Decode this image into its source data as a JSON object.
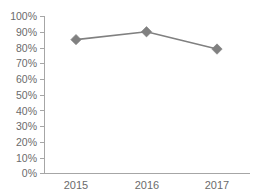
{
  "chart_data": {
    "type": "line",
    "title": "",
    "subtitle": "",
    "xlabel": "",
    "ylabel": "",
    "categories": [
      "2015",
      "2016",
      "2017"
    ],
    "values": [
      85,
      90,
      79
    ],
    "series": [
      {
        "name": "",
        "values": [
          85,
          90,
          79
        ]
      }
    ],
    "ylim": [
      0,
      100
    ],
    "y_tick_values": [
      0,
      10,
      20,
      30,
      40,
      50,
      60,
      70,
      80,
      90,
      100
    ],
    "y_tick_labels": [
      "0%",
      "10%",
      "20%",
      "30%",
      "40%",
      "50%",
      "60%",
      "70%",
      "80%",
      "90%",
      "100%"
    ],
    "x_tick_labels": [
      "2015",
      "2016",
      "2017"
    ],
    "grid": false,
    "legend": false,
    "legend_position": "none",
    "annotations": [],
    "value_format": "percent",
    "colors": {
      "series_line": "#808080",
      "series_marker": "#808080",
      "axis": "#a6a6a6",
      "tick_text": "#6b6b6b",
      "background": "#ffffff"
    },
    "marker_shape": "diamond"
  }
}
